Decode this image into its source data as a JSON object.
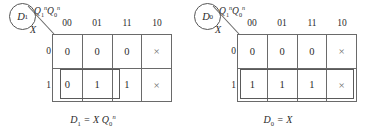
{
  "figure": {
    "type": "karnaugh-map-pair",
    "background_color": "#ffffff",
    "line_color": "#6a6a6a",
    "text_color": "#2b2b2b"
  },
  "maps": [
    {
      "id": "d1",
      "corner_label": "D",
      "corner_label_sub": "1",
      "col_axis": {
        "q1": "Q",
        "q1_sub": "1",
        "q1_sup": "n",
        "q0": "Q",
        "q0_sub": "0",
        "q0_sup": "n"
      },
      "row_axis": "X",
      "col_headers": [
        "00",
        "01",
        "11",
        "10"
      ],
      "row_headers": [
        "0",
        "1"
      ],
      "cells": [
        [
          "0",
          "0",
          "0",
          "×"
        ],
        [
          "0",
          "1",
          "1",
          "×"
        ]
      ],
      "groups": [
        {
          "name": "group-row1-col01-col11",
          "left": 60,
          "top": 69,
          "width": 60,
          "height": 30
        }
      ],
      "formula": {
        "lhs": "D",
        "lhs_sub": "1",
        "eq": "=",
        "rhs": "X Q",
        "rhs_sub": "0",
        "rhs_sup": "n"
      }
    },
    {
      "id": "d0",
      "corner_label": "D",
      "corner_label_sub": "0",
      "col_axis": {
        "q1": "Q",
        "q1_sub": "1",
        "q1_sup": "n",
        "q0": "Q",
        "q0_sub": "0",
        "q0_sup": "n"
      },
      "row_axis": "X",
      "col_headers": [
        "00",
        "01",
        "11",
        "10"
      ],
      "row_headers": [
        "0",
        "1"
      ],
      "cells": [
        [
          "0",
          "0",
          "0",
          "×"
        ],
        [
          "1",
          "1",
          "1",
          "×"
        ]
      ],
      "groups": [
        {
          "name": "group-row1-all-columns",
          "left": 55,
          "top": 69,
          "width": 114,
          "height": 30
        }
      ],
      "formula": {
        "lhs": "D",
        "lhs_sub": "0",
        "eq": "=",
        "rhs": "X",
        "rhs_sub": "",
        "rhs_sup": ""
      }
    }
  ]
}
